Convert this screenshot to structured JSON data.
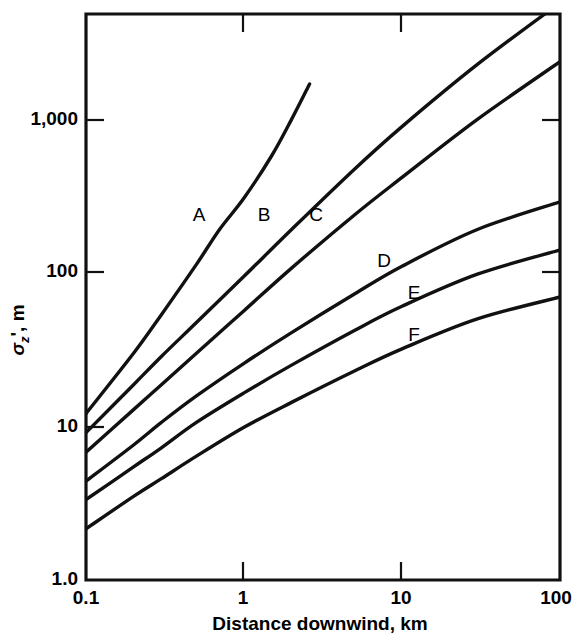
{
  "chart_data": {
    "type": "line",
    "title": "",
    "xlabel": "Distance downwind, km",
    "ylabel": "σz', m",
    "xscale": "log",
    "yscale": "log",
    "xlim": [
      0.1,
      100
    ],
    "ylim": [
      1.0,
      10000
    ],
    "grid": false,
    "legend": "inline-curve-labels",
    "xticks": [
      "0.1",
      "1",
      "10",
      "100"
    ],
    "xtick_values": [
      0.1,
      1,
      10,
      100
    ],
    "yticks": [
      "1.0",
      "10",
      "100",
      "1,000"
    ],
    "ytick_values": [
      1.0,
      10,
      100,
      1000
    ],
    "series": [
      {
        "name": "A",
        "label": "A",
        "x": [
          0.1,
          0.2,
          0.3,
          0.5,
          0.7,
          1.0,
          1.5,
          2.0,
          2.6
        ],
        "y": [
          15,
          40,
          75,
          170,
          300,
          500,
          1000,
          1800,
          3200
        ]
      },
      {
        "name": "B",
        "label": "B",
        "x": [
          0.1,
          0.2,
          0.3,
          0.5,
          1.0,
          2.0,
          5.0,
          10,
          30,
          100
        ],
        "y": [
          11,
          24,
          38,
          66,
          140,
          300,
          800,
          1600,
          4400,
          12000
        ]
      },
      {
        "name": "C",
        "label": "C",
        "x": [
          0.1,
          0.2,
          0.3,
          0.5,
          1.0,
          2.0,
          5.0,
          10,
          30,
          100
        ],
        "y": [
          8,
          16,
          24,
          40,
          80,
          160,
          380,
          700,
          1800,
          4600
        ]
      },
      {
        "name": "D",
        "label": "D",
        "x": [
          0.1,
          0.2,
          0.3,
          0.5,
          1.0,
          2.0,
          5.0,
          10,
          30,
          100
        ],
        "y": [
          5,
          9,
          13,
          20,
          34,
          56,
          105,
          165,
          300,
          470
        ]
      },
      {
        "name": "E",
        "label": "E",
        "x": [
          0.1,
          0.2,
          0.3,
          0.5,
          1.0,
          2.0,
          5.0,
          10,
          30,
          100
        ],
        "y": [
          3.7,
          6.3,
          8.6,
          13,
          21,
          33,
          58,
          86,
          145,
          215
        ]
      },
      {
        "name": "F",
        "label": "F",
        "x": [
          0.1,
          0.2,
          0.3,
          0.5,
          1.0,
          2.0,
          5.0,
          10,
          30,
          100
        ],
        "y": [
          2.3,
          3.9,
          5.2,
          7.5,
          12,
          18,
          30,
          43,
          70,
          100
        ]
      }
    ]
  },
  "axes": {
    "x_title": "Distance downwind, km",
    "y_title_sigma": "σ",
    "y_title_sub": "z",
    "y_title_rest": "', m",
    "x_tick_labels": [
      "0.1",
      "1",
      "10",
      "100"
    ],
    "y_tick_labels": [
      "1,000",
      "100",
      "10",
      "1.0"
    ]
  },
  "curve_labels": [
    {
      "text": "A",
      "x": 199,
      "y": 216
    },
    {
      "text": "B",
      "x": 264,
      "y": 216
    },
    {
      "text": "C",
      "x": 316,
      "y": 216
    },
    {
      "text": "D",
      "x": 384,
      "y": 262
    },
    {
      "text": "E",
      "x": 414,
      "y": 294
    },
    {
      "text": "F",
      "x": 414,
      "y": 336
    }
  ],
  "colors": {
    "ink": "#111111",
    "background": "#ffffff"
  }
}
